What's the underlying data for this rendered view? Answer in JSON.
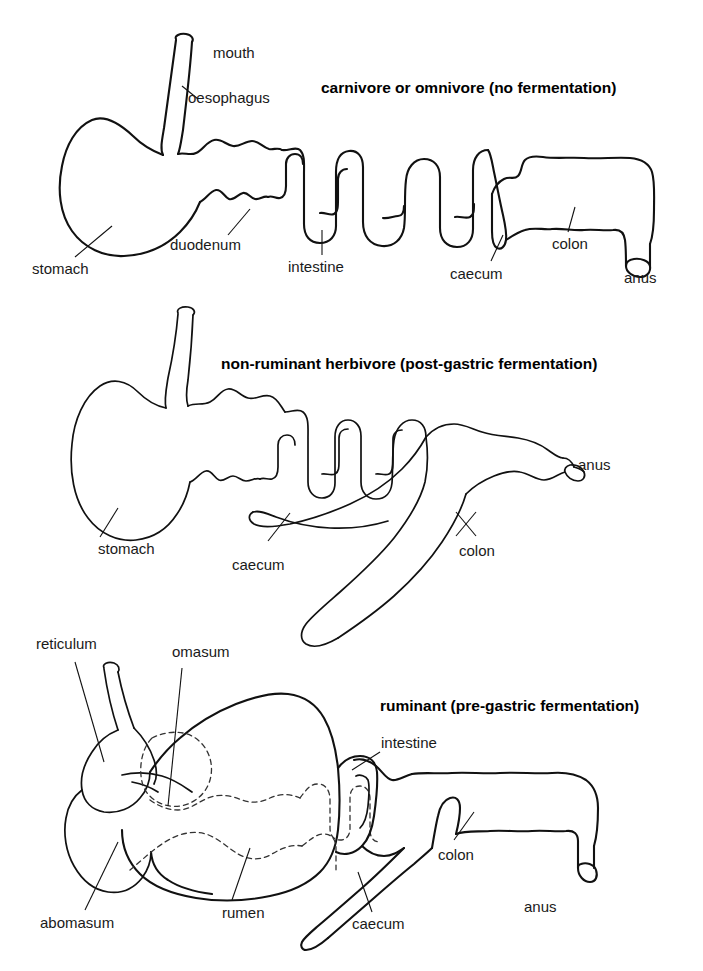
{
  "figure": {
    "kind": "diagram",
    "background_color": "#ffffff",
    "line_color": "#111111",
    "dashed_line_color": "#333333"
  },
  "panels": [
    {
      "id": "carnivore",
      "title": "carnivore or omnivore (no fermentation)",
      "labels": [
        {
          "key": "mouth",
          "text": "mouth"
        },
        {
          "key": "oesophagus",
          "text": "oesophagus"
        },
        {
          "key": "stomach",
          "text": "stomach"
        },
        {
          "key": "duodenum",
          "text": "duodenum"
        },
        {
          "key": "intestine",
          "text": "intestine"
        },
        {
          "key": "caecum",
          "text": "caecum"
        },
        {
          "key": "colon",
          "text": "colon"
        },
        {
          "key": "anus",
          "text": "anus"
        }
      ]
    },
    {
      "id": "non-ruminant-herbivore",
      "title": "non-ruminant herbivore (post-gastric fermentation)",
      "labels": [
        {
          "key": "stomach",
          "text": "stomach"
        },
        {
          "key": "caecum",
          "text": "caecum"
        },
        {
          "key": "colon",
          "text": "colon"
        },
        {
          "key": "anus",
          "text": "anus"
        }
      ]
    },
    {
      "id": "ruminant",
      "title": "ruminant (pre-gastric fermentation)",
      "labels": [
        {
          "key": "reticulum",
          "text": "reticulum"
        },
        {
          "key": "omasum",
          "text": "omasum"
        },
        {
          "key": "abomasum",
          "text": "abomasum"
        },
        {
          "key": "rumen",
          "text": "rumen"
        },
        {
          "key": "intestine",
          "text": "intestine"
        },
        {
          "key": "caecum",
          "text": "caecum"
        },
        {
          "key": "colon",
          "text": "colon"
        },
        {
          "key": "anus",
          "text": "anus"
        }
      ]
    }
  ]
}
